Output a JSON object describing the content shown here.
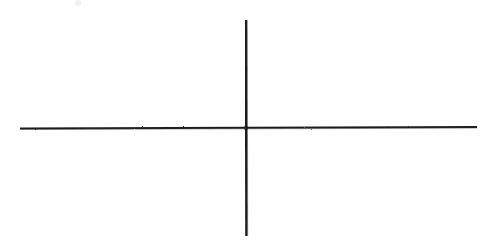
{
  "image": {
    "kind": "line-drawing",
    "description": "Hand-drawn cross / blank coordinate axes on white paper",
    "width": 495,
    "height": 243,
    "background_color": "#fefefe",
    "ink_color": "#1f1f1f"
  },
  "figure": {
    "title": "",
    "caption": "",
    "intersection": {
      "x": 246,
      "y": 128
    },
    "strokes": [
      {
        "name": "horizontal-axis-line",
        "orientation": "horizontal",
        "x1": 20,
        "y1": 128.5,
        "x2": 477,
        "y2": 127.0,
        "thickness": 2.1,
        "color": "#1f1f1f"
      },
      {
        "name": "vertical-axis-line",
        "orientation": "vertical",
        "x1": 246.0,
        "y1": 20,
        "x2": 246.4,
        "y2": 236,
        "thickness": 2.4,
        "color": "#1f1f1f"
      }
    ],
    "artifacts": [
      {
        "name": "paper-speck",
        "x": 78,
        "y": 3,
        "radius": 3.2,
        "color": "#f0f0f0"
      }
    ]
  },
  "chart_data": {
    "type": "line",
    "title": "",
    "subtitle": "",
    "xlabel": "",
    "ylabel": "",
    "grid": false,
    "legend": null,
    "annotations": [],
    "tick_labels": {
      "x": [],
      "y": []
    },
    "xlim": [
      20,
      477
    ],
    "ylim": [
      20,
      236
    ],
    "series": [
      {
        "name": "horizontal-axis-line",
        "x": [
          20,
          477
        ],
        "y": [
          128.5,
          127.0
        ]
      },
      {
        "name": "vertical-axis-line",
        "x": [
          246.0,
          246.4
        ],
        "y": [
          20,
          236
        ]
      }
    ]
  }
}
